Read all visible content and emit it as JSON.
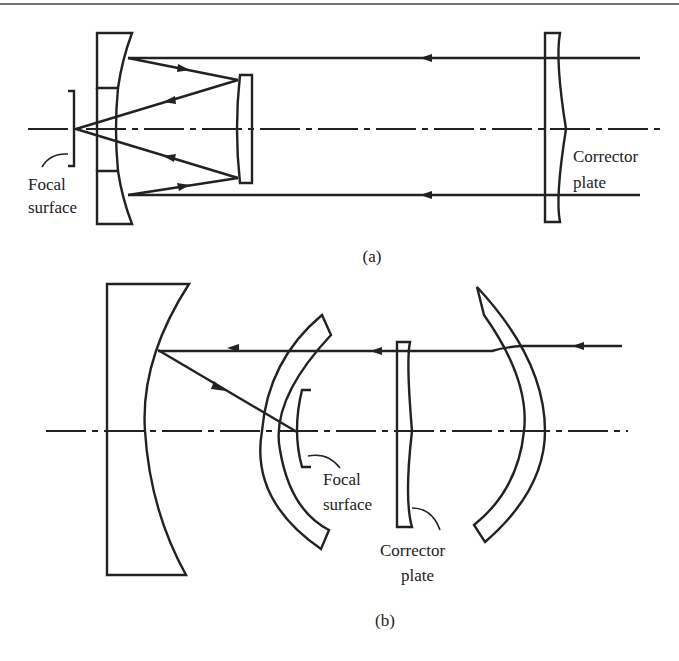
{
  "figure": {
    "panels": [
      {
        "id": "a",
        "caption": "(a)",
        "labels": {
          "focal_surface_line1": "Focal",
          "focal_surface_line2": "surface",
          "corrector_line1": "Corrector",
          "corrector_line2": "plate"
        },
        "components": [
          "primary-mirror-with-hole",
          "secondary-mirror",
          "corrector-plate",
          "focal-surface",
          "optical-axis",
          "light-rays"
        ]
      },
      {
        "id": "b",
        "caption": "(b)",
        "labels": {
          "focal_surface_line1": "Focal",
          "focal_surface_line2": "surface",
          "corrector_line1": "Corrector",
          "corrector_line2": "plate"
        },
        "components": [
          "spherical-mirror",
          "meniscus-shell-left",
          "meniscus-shell-right",
          "corrector-plate",
          "curved-focal-surface",
          "optical-axis",
          "light-ray"
        ]
      }
    ],
    "colors": {
      "ink": "#222222",
      "background": "#ffffff"
    }
  }
}
